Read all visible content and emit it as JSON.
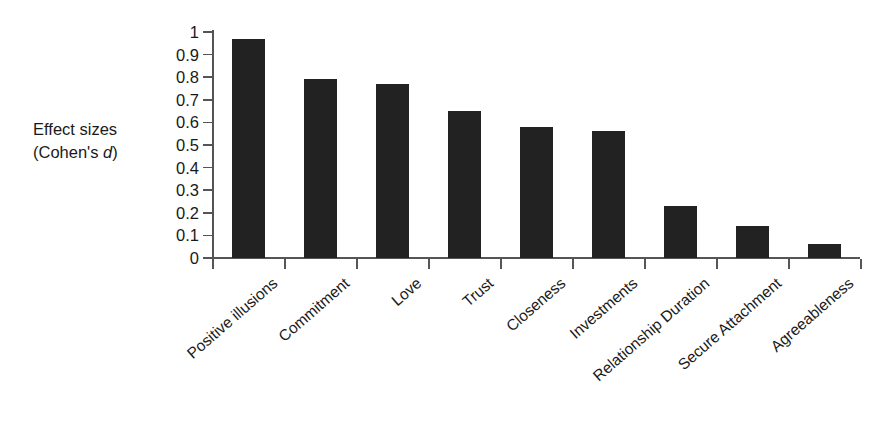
{
  "chart_data": {
    "type": "bar",
    "title": "",
    "subtitle": "",
    "xlabel": "",
    "ylabel": "Effect sizes (Cohen's d)",
    "ylabel_line1": "Effect sizes",
    "ylabel_line2_prefix": "(Cohen's ",
    "ylabel_line2_italic": "d",
    "ylabel_line2_suffix": ")",
    "categories": [
      "Positive illusions",
      "Commitment",
      "Love",
      "Trust",
      "Closeness",
      "Investments",
      "Relationship Duration",
      "Secure Attachment",
      "Agreeableness"
    ],
    "values": [
      0.97,
      0.79,
      0.77,
      0.65,
      0.58,
      0.56,
      0.23,
      0.14,
      0.06
    ],
    "ylim": [
      0,
      1
    ],
    "ytick_labels": [
      "1",
      "0.9",
      "0.8",
      "0.7",
      "0.6",
      "0.5",
      "0.4",
      "0.3",
      "0.2",
      "0.1",
      "0"
    ],
    "ytick_values": [
      1,
      0.9,
      0.8,
      0.7,
      0.6,
      0.5,
      0.4,
      0.3,
      0.2,
      0.1,
      0
    ],
    "grid": false,
    "legend": null,
    "bar_color": "#222222",
    "axis_color": "#555555",
    "background_color": "#ffffff",
    "label_rotation_deg": -41,
    "orientation": "vertical"
  }
}
